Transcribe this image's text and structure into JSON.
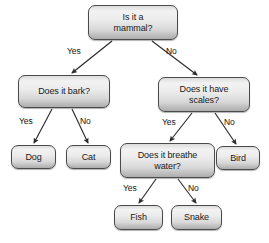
{
  "diagram": {
    "type": "flowchart",
    "colors": {
      "node_border": "#4a4a4a",
      "node_fill_top": "#f2f2f2",
      "node_fill_bottom": "#aeaeae",
      "edge": "#2b2b2b",
      "text": "#1a1a1a",
      "background": "#ffffff"
    },
    "nodes": [
      {
        "id": "is-mammal",
        "label": "Is it a\nmammal?",
        "kind": "decision",
        "x": 88,
        "y": 5,
        "w": 90,
        "h": 35
      },
      {
        "id": "does-bark",
        "label": "Does it bark?",
        "kind": "decision",
        "x": 18,
        "y": 75,
        "w": 92,
        "h": 33
      },
      {
        "id": "has-scales",
        "label": "Does it have\nscales?",
        "kind": "decision",
        "x": 158,
        "y": 77,
        "w": 92,
        "h": 35
      },
      {
        "id": "dog",
        "label": "Dog",
        "kind": "leaf",
        "x": 11,
        "y": 145,
        "w": 45,
        "h": 24
      },
      {
        "id": "cat",
        "label": "Cat",
        "kind": "leaf",
        "x": 66,
        "y": 145,
        "w": 45,
        "h": 24
      },
      {
        "id": "breathe-water",
        "label": "Does it breathe\nwater?",
        "kind": "decision",
        "x": 120,
        "y": 143,
        "w": 95,
        "h": 35
      },
      {
        "id": "bird",
        "label": "Bird",
        "kind": "leaf",
        "x": 216,
        "y": 146,
        "w": 44,
        "h": 24
      },
      {
        "id": "fish",
        "label": "Fish",
        "kind": "leaf",
        "x": 114,
        "y": 205,
        "w": 49,
        "h": 25
      },
      {
        "id": "snake",
        "label": "Snake",
        "kind": "leaf",
        "x": 171,
        "y": 205,
        "w": 51,
        "h": 25
      }
    ],
    "edges": [
      {
        "id": "mammal-yes",
        "from": "is-mammal",
        "to": "does-bark",
        "label": "Yes",
        "x1": 112,
        "y1": 41,
        "x2": 72,
        "y2": 73,
        "label_x": 67,
        "label_y": 47
      },
      {
        "id": "mammal-no",
        "from": "is-mammal",
        "to": "has-scales",
        "label": "No",
        "x1": 152,
        "y1": 41,
        "x2": 197,
        "y2": 75,
        "label_x": 166,
        "label_y": 47
      },
      {
        "id": "bark-yes",
        "from": "does-bark",
        "to": "dog",
        "label": "Yes",
        "x1": 52,
        "y1": 109,
        "x2": 34,
        "y2": 143,
        "label_x": 19,
        "label_y": 117
      },
      {
        "id": "bark-no",
        "from": "does-bark",
        "to": "cat",
        "label": "No",
        "x1": 72,
        "y1": 109,
        "x2": 88,
        "y2": 143,
        "label_x": 80,
        "label_y": 117
      },
      {
        "id": "scales-yes",
        "from": "has-scales",
        "to": "breathe-water",
        "label": "Yes",
        "x1": 192,
        "y1": 113,
        "x2": 170,
        "y2": 141,
        "label_x": 162,
        "label_y": 118
      },
      {
        "id": "scales-no",
        "from": "has-scales",
        "to": "bird",
        "label": "No",
        "x1": 215,
        "y1": 113,
        "x2": 236,
        "y2": 144,
        "label_x": 224,
        "label_y": 118
      },
      {
        "id": "water-yes",
        "from": "breathe-water",
        "to": "fish",
        "label": "Yes",
        "x1": 156,
        "y1": 179,
        "x2": 139,
        "y2": 203,
        "label_x": 123,
        "label_y": 184
      },
      {
        "id": "water-no",
        "from": "breathe-water",
        "to": "snake",
        "label": "No",
        "x1": 178,
        "y1": 179,
        "x2": 196,
        "y2": 203,
        "label_x": 188,
        "label_y": 184
      }
    ]
  }
}
